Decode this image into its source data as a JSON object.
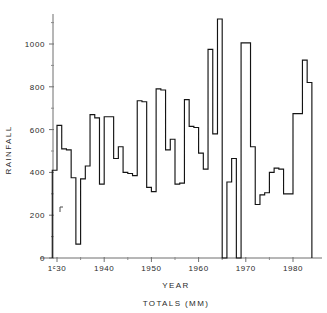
{
  "figure": {
    "background": "#ffffff",
    "ink_color": "#141414",
    "axis_color": "#6e6e6e"
  },
  "labels": {
    "y_axis_title": "RAINFALL",
    "x_axis_title": "YEAR",
    "caption": "TOTALS (MM)"
  },
  "axes": {
    "y_ticks": [
      "0",
      "200",
      "400",
      "600",
      "800",
      "1000"
    ],
    "x_ticks": [
      "1ᶜ30",
      "1940",
      "1950",
      "1960",
      "1970",
      "1980"
    ]
  },
  "chart_data": {
    "type": "line",
    "title": "",
    "subtitle": "",
    "xlabel": "YEAR",
    "ylabel": "RAINFALL",
    "caption": "TOTALS (MM)",
    "step_style": "post",
    "grid": false,
    "legend": "none",
    "xlim": [
      1929,
      1983
    ],
    "ylim": [
      0,
      1150
    ],
    "y_tick_values": [
      0,
      200,
      400,
      600,
      800,
      1000
    ],
    "y_minor_tick_step": 100,
    "x_tick_values": [
      1930,
      1940,
      1950,
      1960,
      1970,
      1980
    ],
    "x_tick_labels": [
      "1ᶜ30",
      "1940",
      "1950",
      "1960",
      "1970",
      "1980"
    ],
    "x_minor_tick_step": 5,
    "series": [
      {
        "name": "Annual rainfall total",
        "units": "mm",
        "x": [
          1929,
          1930,
          1931,
          1932,
          1933,
          1934,
          1935,
          1936,
          1937,
          1938,
          1939,
          1940,
          1941,
          1942,
          1943,
          1944,
          1945,
          1946,
          1947,
          1948,
          1949,
          1950,
          1951,
          1952,
          1953,
          1954,
          1955,
          1956,
          1957,
          1958,
          1959,
          1960,
          1961,
          1962,
          1963,
          1964,
          1965,
          1966,
          1967,
          1968,
          1969,
          1970,
          1971,
          1972,
          1973,
          1974,
          1975,
          1976,
          1977,
          1978,
          1979,
          1980,
          1981,
          1982,
          1983
        ],
        "values": [
          410,
          620,
          510,
          505,
          375,
          65,
          370,
          430,
          670,
          655,
          345,
          660,
          660,
          465,
          520,
          400,
          395,
          385,
          735,
          730,
          330,
          310,
          790,
          785,
          505,
          555,
          345,
          350,
          740,
          615,
          610,
          490,
          415,
          975,
          580,
          1117,
          0,
          355,
          465,
          0,
          1005,
          1005,
          520,
          250,
          295,
          305,
          400,
          420,
          415,
          300,
          300,
          675,
          675,
          925,
          820
        ]
      }
    ],
    "extrema": {
      "maximum": {
        "year": 1964,
        "value": 1117
      },
      "minimum": {
        "year": 1965,
        "value": 0
      }
    }
  },
  "render_path": {
    "comment": "Pixel-space polyline for the step trace, coordinates in screenshot px",
    "points": "53,170 53,170 57,170 57,125 60,125 60,151 65,151 65,180 67,180 67,244 72,244 72,180 75,180 170,180"
  }
}
